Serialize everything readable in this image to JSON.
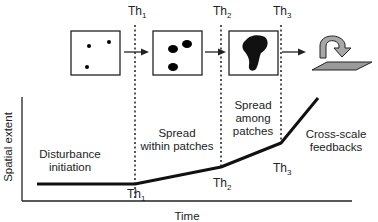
{
  "thresholds": [
    {
      "name": "Th",
      "sub": "1"
    },
    {
      "name": "Th",
      "sub": "2"
    },
    {
      "name": "Th",
      "sub": "3"
    }
  ],
  "phases": [
    {
      "lines": [
        "Disturbance",
        "initiation"
      ]
    },
    {
      "lines": [
        "Spread",
        "within patches"
      ]
    },
    {
      "lines": [
        "Spread",
        "among",
        "patches"
      ]
    },
    {
      "lines": [
        "Cross-scale",
        "feedbacks"
      ]
    }
  ],
  "axes": {
    "x_label": "Time",
    "y_label": "Spatial extent"
  },
  "panels": [
    {
      "name": "disturbance-initiation-panel",
      "depicts": "three small scattered dots"
    },
    {
      "name": "spread-within-patches-panel",
      "depicts": "three larger blobs"
    },
    {
      "name": "spread-among-patches-panel",
      "depicts": "single large merged patch"
    },
    {
      "name": "cross-scale-feedbacks-icon",
      "depicts": "curved arrow over landscape plane"
    }
  ],
  "colors": {
    "ink": "#111111",
    "plane_fill": "#9a9a9a",
    "arrow_fill": "#a8a8a8"
  }
}
